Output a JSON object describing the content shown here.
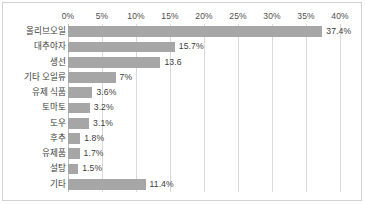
{
  "chart_data": {
    "type": "bar",
    "orientation": "horizontal",
    "title": "",
    "subtitle": "",
    "xlabel": "",
    "ylabel": "",
    "xlim": [
      0,
      40
    ],
    "grid": true,
    "legend": false,
    "legend_position": "none",
    "bar_color": "#a6a6a6",
    "gridline_color": "#d9d9d9",
    "axis_tick_labels": [
      "0%",
      "5%",
      "10%",
      "15%",
      "20%",
      "25%",
      "30%",
      "35%",
      "40%"
    ],
    "axis_tick_values": [
      0,
      5,
      10,
      15,
      20,
      25,
      30,
      35,
      40
    ],
    "categories": [
      "올리브오일",
      "대추야자",
      "생선",
      "기타 오일류",
      "유제 식품",
      "토마토",
      "도우",
      "후추",
      "유제품",
      "설탕",
      "기타"
    ],
    "values": [
      37.4,
      15.7,
      13.6,
      7.0,
      3.6,
      3.2,
      3.1,
      1.8,
      1.7,
      1.5,
      11.4
    ],
    "data_labels": [
      "37.4%",
      "15.7%",
      "13.6",
      "7%",
      "3.6%",
      "3.2%",
      "3.1%",
      "1.8%",
      "1.7%",
      "1.5%",
      "11.4%"
    ]
  }
}
